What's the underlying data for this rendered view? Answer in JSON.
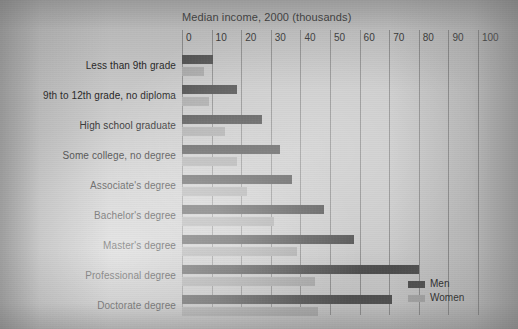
{
  "chart_data": {
    "type": "bar",
    "orientation": "horizontal",
    "title": "Median income, 2000 (thousands)",
    "xlabel": "",
    "ylabel": "",
    "xlim": [
      0,
      100
    ],
    "xticks": [
      0,
      10,
      20,
      30,
      40,
      50,
      60,
      70,
      80,
      90,
      100
    ],
    "xtick_labels": [
      "0",
      "10",
      "20",
      "30",
      "40",
      "50",
      "60",
      "70",
      "80",
      "90",
      "100"
    ],
    "grid": true,
    "legend_position": "bottom-right",
    "categories": [
      "Less than 9th grade",
      "9th to 12th grade, no diploma",
      "High school graduate",
      "Some college, no degree",
      "Associate's degree",
      "Bachelor's degree",
      "Master's degree",
      "Professional degree",
      "Doctorate degree"
    ],
    "series": [
      {
        "name": "Men",
        "color": "#4c4c4c",
        "values": [
          10.5,
          18.5,
          27,
          33,
          37,
          48,
          58,
          80,
          71
        ]
      },
      {
        "name": "Women",
        "color": "#a9a9a9",
        "values": [
          7.5,
          9,
          14.5,
          18.5,
          22,
          31,
          39,
          45,
          46
        ]
      }
    ]
  },
  "legend": {
    "entries": [
      {
        "label": "Men",
        "color": "#4c4c4c"
      },
      {
        "label": "Women",
        "color": "#a9a9a9"
      }
    ]
  },
  "colors": {
    "men_bar": "#4c4c4c",
    "women_bar": "#a9a9a9",
    "gridline": "#8d8d8d",
    "text": "#222222",
    "page_background": "#c9c9c9"
  }
}
